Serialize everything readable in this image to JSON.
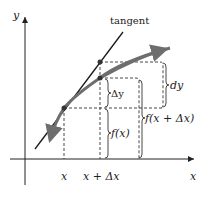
{
  "diagram": {
    "axis_labels": {
      "x": "x",
      "y": "y"
    },
    "tick_labels": {
      "x_point": "x",
      "x_plus_dx": "x + Δx"
    },
    "curve_label": "tangent",
    "brace_labels": {
      "delta_y": "Δy",
      "dy": "dy",
      "f_x": "f(x)",
      "f_x_plus_dx": "f(x + Δx)"
    },
    "colors": {
      "axes": "#222222",
      "curve": "#6e6e6e",
      "tangent": "#1a1a1a",
      "dashed": "#333333",
      "background": "#ffffff"
    }
  }
}
